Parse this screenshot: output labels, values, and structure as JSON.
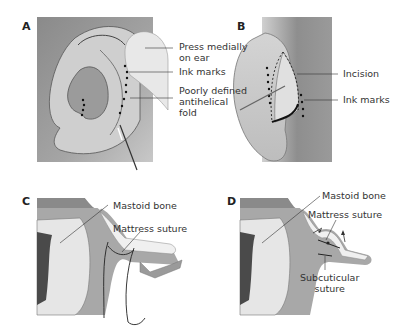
{
  "figure": {
    "panels": [
      {
        "letter": "A",
        "labels": {
          "press": [
            "Press medially",
            "on ear"
          ],
          "ink": "Ink marks",
          "fold": [
            "Poorly defined",
            "antihelical",
            "fold"
          ]
        }
      },
      {
        "letter": "B",
        "labels": {
          "incision": "Incision",
          "ink": "Ink marks"
        }
      },
      {
        "letter": "C",
        "labels": {
          "bone": "Mastoid bone",
          "suture": "Mattress suture"
        }
      },
      {
        "letter": "D",
        "labels": {
          "bone": "Mastoid bone",
          "suture": "Mattress suture",
          "subcut": [
            "Subcuticular",
            "suture"
          ]
        }
      }
    ],
    "colors": {
      "background_gray": "#8f8f8f",
      "skin_light": "#d9d9d9",
      "skin_mid": "#bdbdbd",
      "concha_dark": "#9a9a9a",
      "cartilage": "#f0f0f0",
      "bone_dark": "#4a4a4a",
      "line": "#333333"
    }
  }
}
